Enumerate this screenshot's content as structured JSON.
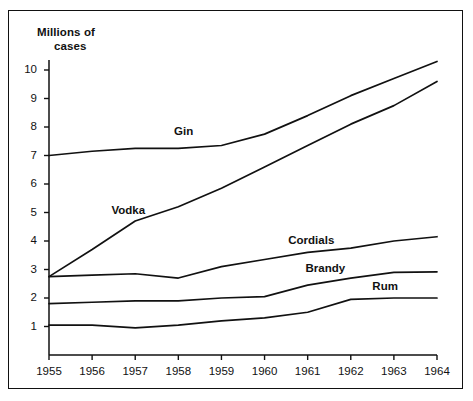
{
  "chart_data": {
    "type": "line",
    "title": "",
    "subtitle": "",
    "ylabel_line1": "Millions of",
    "ylabel_line2": "cases",
    "xlabel": "",
    "x": [
      1955,
      1956,
      1957,
      1958,
      1959,
      1960,
      1961,
      1962,
      1963,
      1964
    ],
    "categories": [
      "1955",
      "1956",
      "1957",
      "1958",
      "1959",
      "1960",
      "1961",
      "1962",
      "1963",
      "1964"
    ],
    "yticks": [
      1,
      2,
      3,
      4,
      5,
      6,
      7,
      8,
      9,
      10
    ],
    "ytick_labels": [
      "1",
      "2",
      "3",
      "4",
      "5",
      "6",
      "7",
      "8",
      "9",
      "10"
    ],
    "ylim": [
      0,
      10.6
    ],
    "xlim": [
      1955,
      1964
    ],
    "grid": false,
    "legend": "inline-labels",
    "line_color": "#111111",
    "series": [
      {
        "name": "Gin",
        "label": "Gin",
        "values": [
          7.0,
          7.15,
          7.25,
          7.25,
          7.35,
          7.75,
          8.4,
          9.1,
          9.7,
          10.3
        ],
        "label_x": 1957.9,
        "label_y": 7.85
      },
      {
        "name": "Vodka",
        "label": "Vodka",
        "values": [
          2.75,
          3.7,
          4.7,
          5.2,
          5.85,
          6.6,
          7.35,
          8.1,
          8.75,
          9.6
        ],
        "label_x": 1956.45,
        "label_y": 5.1
      },
      {
        "name": "Cordials",
        "label": "Cordials",
        "values": [
          2.75,
          2.8,
          2.85,
          2.7,
          3.1,
          3.35,
          3.6,
          3.75,
          4.0,
          4.15
        ],
        "label_x": 1960.55,
        "label_y": 4.05
      },
      {
        "name": "Brandy",
        "label": "Brandy",
        "values": [
          1.8,
          1.85,
          1.9,
          1.9,
          2.0,
          2.05,
          2.45,
          2.7,
          2.9,
          2.92
        ],
        "label_x": 1960.95,
        "label_y": 3.04
      },
      {
        "name": "Rum",
        "label": "Rum",
        "values": [
          1.05,
          1.05,
          0.95,
          1.05,
          1.2,
          1.3,
          1.5,
          1.95,
          2.0,
          2.0
        ],
        "label_x": 1962.5,
        "label_y": 2.42
      }
    ]
  }
}
